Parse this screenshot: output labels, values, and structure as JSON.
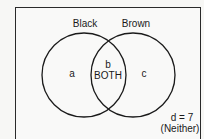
{
  "diagram": {
    "type": "venn",
    "sets": [
      {
        "name": "Black",
        "region_label": "a"
      },
      {
        "name": "Brown",
        "region_label": "c"
      }
    ],
    "intersection": {
      "region_label": "b",
      "description": "BOTH"
    },
    "outside": {
      "region_label": "d = 7",
      "description": "(Neither)"
    },
    "colors": {
      "stroke": "#1a1a1a",
      "background": "#f9f9f8"
    }
  }
}
